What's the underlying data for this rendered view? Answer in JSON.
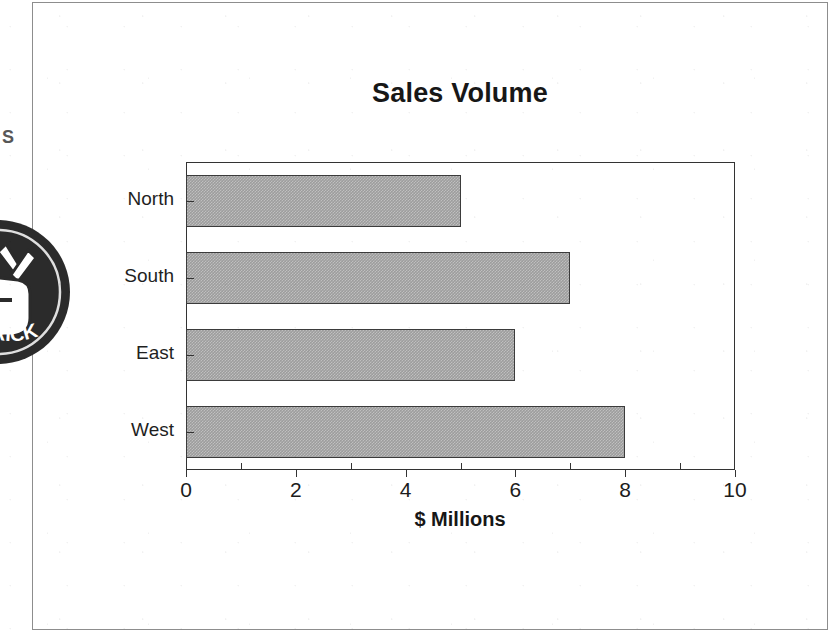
{
  "page": {
    "frame_color": "#4a4a4a",
    "background": "#ffffff"
  },
  "stamp": {
    "name": "circular-rubber-stamp",
    "arc_text": "RICK",
    "margin_letter": "S",
    "color": "#2b2b2b"
  },
  "chart_data": {
    "type": "bar",
    "orientation": "horizontal",
    "title": "Sales Volume",
    "xlabel": "$ Millions",
    "ylabel": "",
    "categories": [
      "North",
      "South",
      "East",
      "West"
    ],
    "values": [
      5,
      7,
      6,
      8
    ],
    "xlim": [
      0,
      10
    ],
    "xticks": [
      0,
      2,
      4,
      6,
      8,
      10
    ],
    "xtick_labels": [
      "0",
      "2",
      "4",
      "6",
      "8",
      "10"
    ],
    "minor_xticks": [
      1,
      3,
      5,
      7,
      9
    ],
    "grid": false,
    "legend": null,
    "bar_fill": "#9d9d9d",
    "bar_edge": "#3b3b3b",
    "axes_color": "#333333"
  }
}
